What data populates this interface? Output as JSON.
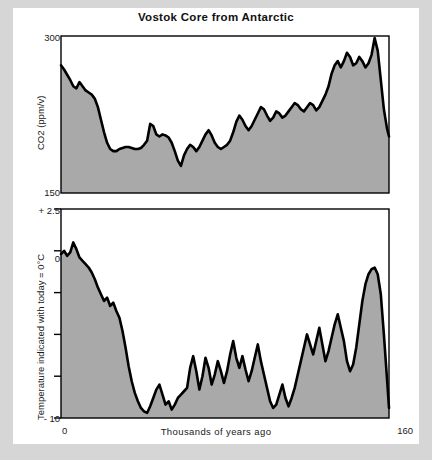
{
  "chart_data": [
    {
      "type": "area",
      "id": "co2-panel",
      "title": "Vostok Core from Antarctic",
      "xlabel": "",
      "ylabel": "CO2 (ppm/v)",
      "xlim": [
        0,
        160
      ],
      "ylim": [
        150,
        300
      ],
      "ytick_labels": [
        "300",
        "150"
      ],
      "ytick_values": [
        300,
        150
      ],
      "xtick_labels": [],
      "grid": false,
      "legend": false,
      "line_color": "#000000",
      "fill_color": "#a9a9a9",
      "x": [
        0,
        1.5,
        3,
        4.5,
        6,
        7.5,
        9,
        10.5,
        12,
        13.5,
        15,
        16.5,
        18,
        19.5,
        21,
        22.5,
        24,
        25.5,
        27,
        28.5,
        30,
        31.5,
        33,
        34.5,
        36,
        37.5,
        39,
        40.5,
        42,
        43.5,
        45,
        46.5,
        48,
        49.5,
        51,
        52.5,
        54,
        55.5,
        57,
        58.5,
        60,
        61.5,
        63,
        64.5,
        66,
        67.5,
        69,
        70.5,
        72,
        73.5,
        75,
        76.5,
        78,
        79.5,
        81,
        82.5,
        84,
        85.5,
        87,
        88.5,
        90,
        91.5,
        93,
        94.5,
        96,
        97.5,
        99,
        100.5,
        102,
        103.5,
        105,
        106.5,
        108,
        109.5,
        111,
        112.5,
        114,
        115.5,
        117,
        118.5,
        120,
        121.5,
        123,
        124.5,
        126,
        127.5,
        129,
        130.5,
        132,
        133.5,
        135,
        136.5,
        138,
        139.5,
        141,
        142.5,
        144,
        145.5,
        147,
        148.5,
        150,
        151.5,
        153,
        154.5,
        156,
        157.5,
        159,
        160
      ],
      "values": [
        272,
        268,
        263,
        258,
        252,
        250,
        256,
        252,
        248,
        246,
        244,
        240,
        232,
        220,
        208,
        198,
        192,
        190,
        190,
        192,
        193,
        194,
        194,
        193,
        192,
        192,
        193,
        196,
        200,
        216,
        214,
        206,
        204,
        206,
        205,
        203,
        198,
        190,
        181,
        176,
        186,
        192,
        196,
        194,
        190,
        194,
        200,
        206,
        210,
        205,
        198,
        194,
        192,
        194,
        196,
        200,
        208,
        218,
        224,
        220,
        214,
        210,
        214,
        220,
        226,
        232,
        230,
        224,
        219,
        222,
        228,
        226,
        222,
        224,
        228,
        232,
        236,
        234,
        230,
        228,
        232,
        236,
        234,
        229,
        232,
        238,
        244,
        252,
        264,
        272,
        276,
        270,
        276,
        284,
        280,
        272,
        274,
        280,
        276,
        270,
        274,
        282,
        298,
        286,
        258,
        230,
        212,
        204,
        206,
        204
      ]
    },
    {
      "type": "area",
      "id": "temperature-panel",
      "title": "",
      "xlabel": "Thousands of years ago",
      "ylabel": "Temperature indicated with today = 0°C",
      "xlim": [
        0,
        160
      ],
      "ylim": [
        -10,
        2.5
      ],
      "ytick_labels": [
        "+ 2.5",
        "0",
        "",
        "",
        "",
        "- 10"
      ],
      "ytick_values": [
        2.5,
        0,
        -2.5,
        -5,
        -7.5,
        -10
      ],
      "xtick_labels": [
        "0",
        "160"
      ],
      "xtick_values": [
        0,
        160
      ],
      "grid": false,
      "legend": false,
      "line_color": "#000000",
      "fill_color": "#a9a9a9",
      "x": [
        0,
        1.5,
        3,
        4.5,
        6,
        7.5,
        9,
        10.5,
        12,
        13.5,
        15,
        16.5,
        18,
        19.5,
        21,
        22.5,
        24,
        25.5,
        27,
        28.5,
        30,
        31.5,
        33,
        34.5,
        36,
        37.5,
        39,
        40.5,
        42,
        43.5,
        45,
        46.5,
        48,
        49.5,
        51,
        52.5,
        54,
        55.5,
        57,
        58.5,
        60,
        61.5,
        63,
        64.5,
        66,
        67.5,
        69,
        70.5,
        72,
        73.5,
        75,
        76.5,
        78,
        79.5,
        81,
        82.5,
        84,
        85.5,
        87,
        88.5,
        90,
        91.5,
        93,
        94.5,
        96,
        97.5,
        99,
        100.5,
        102,
        103.5,
        105,
        106.5,
        108,
        109.5,
        111,
        112.5,
        114,
        115.5,
        117,
        118.5,
        120,
        121.5,
        123,
        124.5,
        126,
        127.5,
        129,
        130.5,
        132,
        133.5,
        135,
        136.5,
        138,
        139.5,
        141,
        142.5,
        144,
        145.5,
        147,
        148.5,
        150,
        151.5,
        153,
        154.5,
        156,
        157.5,
        159,
        160
      ],
      "values": [
        -0.2,
        0.0,
        -0.3,
        -0.1,
        0.5,
        0.1,
        -0.4,
        -0.6,
        -0.8,
        -1.0,
        -1.3,
        -1.7,
        -2.2,
        -2.6,
        -3.0,
        -2.8,
        -3.3,
        -3.1,
        -3.6,
        -4.0,
        -4.8,
        -5.8,
        -6.9,
        -7.8,
        -8.5,
        -9.0,
        -9.4,
        -9.6,
        -9.7,
        -9.3,
        -8.8,
        -8.3,
        -8.0,
        -8.6,
        -9.2,
        -9.0,
        -9.5,
        -9.2,
        -8.8,
        -8.6,
        -8.4,
        -8.2,
        -7.0,
        -6.3,
        -7.2,
        -8.3,
        -7.5,
        -6.4,
        -7.0,
        -8.0,
        -7.4,
        -6.6,
        -7.2,
        -7.9,
        -7.2,
        -6.2,
        -5.4,
        -6.4,
        -7.0,
        -6.3,
        -7.1,
        -7.8,
        -7.2,
        -6.4,
        -5.6,
        -6.6,
        -7.4,
        -8.2,
        -9.0,
        -9.4,
        -9.2,
        -8.6,
        -8.0,
        -8.8,
        -9.3,
        -8.8,
        -8.2,
        -7.4,
        -6.6,
        -5.8,
        -5.0,
        -5.6,
        -6.2,
        -5.4,
        -4.6,
        -5.6,
        -6.6,
        -6.0,
        -5.2,
        -4.4,
        -3.8,
        -4.6,
        -5.4,
        -6.6,
        -7.2,
        -6.8,
        -5.8,
        -4.4,
        -3.0,
        -2.0,
        -1.4,
        -1.1,
        -1.0,
        -1.4,
        -2.6,
        -5.0,
        -7.6,
        -9.4,
        -9.8
      ]
    }
  ],
  "axis_text": {
    "co2_ylabel": "CO2 (ppm/v)",
    "co2_top_tick": "300",
    "co2_bottom_tick": "150",
    "temp_ylabel": "Temperature indicated with today = 0°C",
    "temp_top_tick": "+ 2.5",
    "temp_zero_tick": "0",
    "temp_bottom_tick": "- 10",
    "x_left_tick": "0",
    "x_right_tick": "160",
    "xlabel": "Thousands of years ago"
  },
  "colors": {
    "page_background": "#d6d6d6",
    "card_background": "#ffffff",
    "fill": "#a9a9a9",
    "line": "#000000",
    "axis": "#000000",
    "text": "#1a1a1a"
  }
}
